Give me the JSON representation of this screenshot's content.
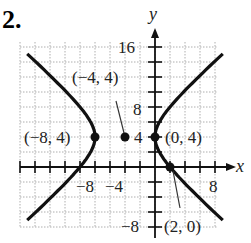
{
  "problem_number": "2.",
  "chart_data": {
    "type": "line",
    "title": "",
    "equation_hint": "hyperbola, center (-4,4), horizontal transverse axis",
    "xlabel": "x",
    "ylabel": "y",
    "xlim": [
      -15,
      9
    ],
    "ylim": [
      -9,
      18
    ],
    "grid": true,
    "grid_step": 2,
    "x_tick_labels": [
      {
        "value": -8,
        "text": "−8"
      },
      {
        "value": -4,
        "text": "−4"
      },
      {
        "value": 8,
        "text": "8"
      }
    ],
    "y_tick_labels": [
      {
        "value": 16,
        "text": "16"
      },
      {
        "value": 8,
        "text": "8"
      },
      {
        "value": 4,
        "text": "4"
      },
      {
        "value": -8,
        "text": "−8"
      }
    ],
    "points": [
      {
        "x": -8,
        "y": 4,
        "label": "(−8, 4)"
      },
      {
        "x": -4,
        "y": 4,
        "label": "(−4, 4)"
      },
      {
        "x": 0,
        "y": 4,
        "label": "(0, 4)"
      },
      {
        "x": 2,
        "y": 0,
        "label": "(2, 0)"
      }
    ],
    "curve": {
      "center": [
        -4,
        4
      ],
      "a": 4,
      "b2": 12.8
    }
  },
  "labels": {
    "y16": "16",
    "y8": "8",
    "y4": "4",
    "yneg8": "−8",
    "xneg8": "−8",
    "xneg4": "−4",
    "x8": "8",
    "x_axis": "x",
    "y_axis": "y",
    "p_m8_4": "(−8, 4)",
    "p_m4_4": "(−4, 4)",
    "p_0_4": "(0, 4)",
    "p_2_0": "(2, 0)"
  },
  "colors": {
    "curve": "#111111",
    "grid": "#9a9a9a",
    "axis": "#111111"
  }
}
